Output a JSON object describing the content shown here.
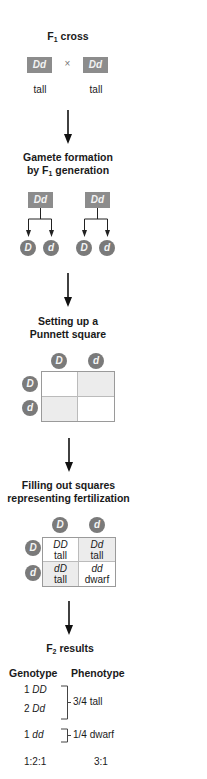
{
  "steps": {
    "f1_cross": {
      "title": "F",
      "title_sub": "1",
      "title_rest": " cross",
      "parent1": "Dd",
      "parent2": "Dd",
      "cross_symbol": "×",
      "phenotype1": "tall",
      "phenotype2": "tall"
    },
    "gamete_formation": {
      "title_line1": "Gamete formation",
      "title_line2a": "by F",
      "title_line2_sub": "1",
      "title_line2b": " generation",
      "parents": [
        "Dd",
        "Dd"
      ],
      "gametes": [
        "D",
        "d",
        "D",
        "d"
      ]
    },
    "punnett_setup": {
      "title_line1": "Setting up a",
      "title_line2": "Punnett square",
      "col_headers": [
        "D",
        "d"
      ],
      "row_headers": [
        "D",
        "d"
      ]
    },
    "fertilization": {
      "title_line1": "Filling out squares",
      "title_line2": "representing fertilization",
      "col_headers": [
        "D",
        "d"
      ],
      "row_headers": [
        "D",
        "d"
      ],
      "cells": [
        [
          {
            "genotype": "DD",
            "phenotype": "tall"
          },
          {
            "genotype": "Dd",
            "phenotype": "tall"
          }
        ],
        [
          {
            "genotype": "dD",
            "phenotype": "tall"
          },
          {
            "genotype": "dd",
            "phenotype": "dwarf"
          }
        ]
      ]
    },
    "f2_results": {
      "title": "F",
      "title_sub": "2",
      "title_rest": " results",
      "genotype_header": "Genotype",
      "phenotype_header": "Phenotype",
      "genotypes": [
        {
          "count": "1",
          "genotype": "DD"
        },
        {
          "count": "2",
          "genotype": "Dd"
        },
        {
          "count": "1",
          "genotype": "dd"
        }
      ],
      "phenotypes": [
        "3/4 tall",
        "1/4 dwarf"
      ],
      "genotype_ratio": "1:2:1",
      "phenotype_ratio": "3:1"
    }
  },
  "colors": {
    "box_gray": "#8c8c8c",
    "circle_gray": "#7a7a7a",
    "shaded_cell": "#ececec",
    "grid_border": "#9a9a9a"
  }
}
